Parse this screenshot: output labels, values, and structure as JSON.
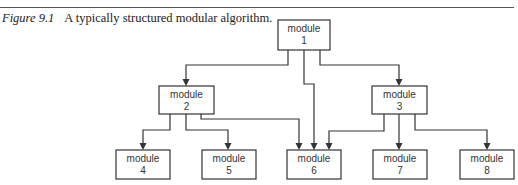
{
  "caption": {
    "figure_label": "Figure 9.1",
    "text": "A typically structured modular algorithm."
  },
  "modules": [
    {
      "id": "1",
      "word": "module",
      "number": "1"
    },
    {
      "id": "2",
      "word": "module",
      "number": "2"
    },
    {
      "id": "3",
      "word": "module",
      "number": "3"
    },
    {
      "id": "4",
      "word": "module",
      "number": "4"
    },
    {
      "id": "5",
      "word": "module",
      "number": "5"
    },
    {
      "id": "6",
      "word": "module",
      "number": "6"
    },
    {
      "id": "7",
      "word": "module",
      "number": "7"
    },
    {
      "id": "8",
      "word": "module",
      "number": "8"
    }
  ],
  "edges": [
    {
      "from": "1",
      "to": "2"
    },
    {
      "from": "1",
      "to": "6"
    },
    {
      "from": "1",
      "to": "3"
    },
    {
      "from": "2",
      "to": "4"
    },
    {
      "from": "2",
      "to": "5"
    },
    {
      "from": "2",
      "to": "6"
    },
    {
      "from": "3",
      "to": "6"
    },
    {
      "from": "3",
      "to": "7"
    },
    {
      "from": "3",
      "to": "8"
    }
  ]
}
